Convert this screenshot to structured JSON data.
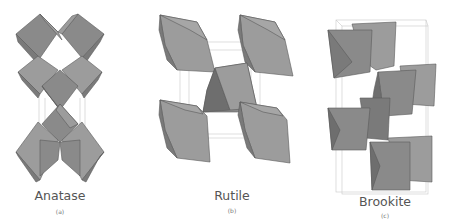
{
  "figure": {
    "panels": [
      {
        "id": "a",
        "name": "Anatase",
        "sublabel": "(a)"
      },
      {
        "id": "b",
        "name": "Rutile",
        "sublabel": "(b)"
      },
      {
        "id": "c",
        "name": "Brookite",
        "sublabel": "(c)"
      }
    ],
    "colors": {
      "background": "#ffffff",
      "octahedron_face": "#8a8a8a",
      "octahedron_edge": "#5a5a5a",
      "unit_cell_line": "#c8c8c8",
      "label_text": "#555555"
    }
  }
}
